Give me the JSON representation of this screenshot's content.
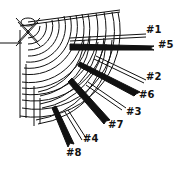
{
  "diagram": {
    "stroke_color": "#111111",
    "background": "#ffffff",
    "spokes": [
      {
        "label": "#1",
        "x": 147,
        "y": 31,
        "end": [
          146,
          36
        ],
        "style": "light",
        "tilt": -10
      },
      {
        "label": "#5",
        "x": 160,
        "y": 43,
        "end": [
          154,
          49
        ],
        "style": "dark",
        "tilt": -8
      },
      {
        "label": "#2",
        "x": 147,
        "y": 74,
        "end": [
          146,
          80
        ],
        "style": "light",
        "tilt": -20
      },
      {
        "label": "#6",
        "x": 141,
        "y": 93,
        "end": [
          140,
          91
        ],
        "style": "dark",
        "tilt": -15
      },
      {
        "label": "#3",
        "x": 127,
        "y": 109,
        "end": [
          126,
          112
        ],
        "style": "light",
        "tilt": -20
      },
      {
        "label": "#7",
        "x": 109,
        "y": 122,
        "end": [
          110,
          124
        ],
        "style": "dark",
        "tilt": -15
      },
      {
        "label": "#4",
        "x": 83,
        "y": 136,
        "end": [
          85,
          138
        ],
        "style": "light",
        "tilt": -25
      },
      {
        "label": "#8",
        "x": 66,
        "y": 148,
        "end": [
          72,
          148
        ],
        "style": "dark",
        "tilt": -20
      }
    ]
  }
}
